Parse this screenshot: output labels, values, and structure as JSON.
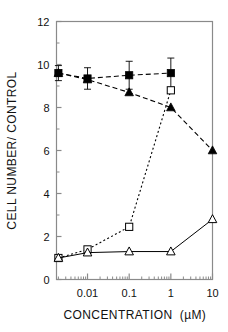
{
  "chart_data": {
    "type": "line",
    "title": "",
    "xlabel": "CONCENTRATION   (µM)",
    "ylabel": "CELL NUMBER/ CONTROL",
    "xscale": "log",
    "xlim": [
      0.0018,
      10
    ],
    "ylim": [
      0,
      12
    ],
    "yticks": [
      0,
      2,
      4,
      6,
      8,
      10,
      12
    ],
    "ytick_labels": [
      "0",
      "2",
      "4",
      "6",
      "8",
      "10",
      "12"
    ],
    "xticks": [
      0.01,
      0.1,
      1,
      10
    ],
    "xtick_labels": [
      "0.01",
      "0.1",
      "1",
      "10"
    ],
    "grid": false,
    "legend": "none",
    "series": [
      {
        "name": "filled-square",
        "marker": "filled-square",
        "linestyle": "dashed",
        "color": "#000000",
        "x": [
          0.002,
          0.01,
          0.1,
          1
        ],
        "values": [
          9.6,
          9.35,
          9.5,
          9.6
        ],
        "yerr": [
          0.35,
          0.5,
          0.65,
          0.7
        ]
      },
      {
        "name": "filled-triangle",
        "marker": "filled-triangle",
        "linestyle": "dashed",
        "color": "#000000",
        "x": [
          0.002,
          0.01,
          0.1,
          1,
          10
        ],
        "values": [
          9.6,
          9.3,
          8.7,
          8.0,
          6.0
        ],
        "yerr": [
          0,
          0,
          0,
          0,
          0
        ]
      },
      {
        "name": "open-square",
        "marker": "open-square",
        "linestyle": "dotted",
        "color": "#000000",
        "x": [
          0.002,
          0.01,
          0.1,
          1
        ],
        "values": [
          1.0,
          1.4,
          2.45,
          8.8
        ],
        "yerr": [
          0,
          0,
          0.12,
          0
        ]
      },
      {
        "name": "open-triangle",
        "marker": "open-triangle",
        "linestyle": "solid",
        "color": "#000000",
        "x": [
          0.002,
          0.01,
          0.1,
          1,
          10
        ],
        "values": [
          1.0,
          1.25,
          1.3,
          1.3,
          2.8
        ],
        "yerr": [
          0,
          0,
          0,
          0,
          0
        ]
      }
    ]
  },
  "figure": {
    "ylabel": "CELL NUMBER/ CONTROL",
    "xlabel_main": "CONCENTRATION",
    "xlabel_unit": "(µM)",
    "ytick_0": "0",
    "ytick_2": "2",
    "ytick_4": "4",
    "ytick_6": "6",
    "ytick_8": "8",
    "ytick_10": "10",
    "ytick_12": "12",
    "xtick_001": "0.01",
    "xtick_01": "0.1",
    "xtick_1": "1",
    "xtick_10": "10",
    "frame_color": "#8a8a8a",
    "ink_color": "#000000"
  }
}
